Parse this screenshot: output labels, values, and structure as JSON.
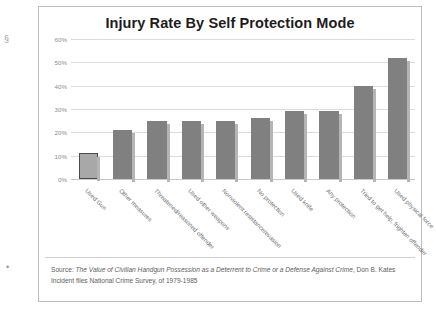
{
  "chart_data": {
    "type": "bar",
    "title": "Injury Rate By Self Protection Mode",
    "xlabel": "",
    "ylabel": "",
    "ylim": [
      0,
      60
    ],
    "grid": true,
    "legend": "none",
    "ytick_labels": [
      "60%",
      "50%",
      "40%",
      "30%",
      "20%",
      "10%",
      "0%"
    ],
    "ytick_values": [
      60,
      50,
      40,
      30,
      20,
      10,
      0
    ],
    "categories": [
      "Used Gun",
      "Other measures",
      "Threatened/reasoned offender",
      "Used other weapons",
      "Nonviolent resistance/evasion",
      "No protection",
      "Used knife",
      "Any protection",
      "Tried to get help, frighten offender",
      "Used physical force"
    ],
    "values": [
      11,
      21,
      25,
      25,
      25,
      26,
      29,
      29,
      40,
      52
    ],
    "highlighted_index": 0,
    "bar_color": "#808080",
    "highlight_color": "#a8a8a8"
  },
  "source": {
    "prefix": "Source: ",
    "title_italic": "The Value of Civilian Handgun Possession as a Deterrent to Crime or a Defense Against Crime",
    "author": ", Don B. Kates",
    "line2": "Incident files National Crime Survey, of 1979-1985"
  },
  "scan_marks": {
    "top": "§",
    "bottom": "•"
  }
}
